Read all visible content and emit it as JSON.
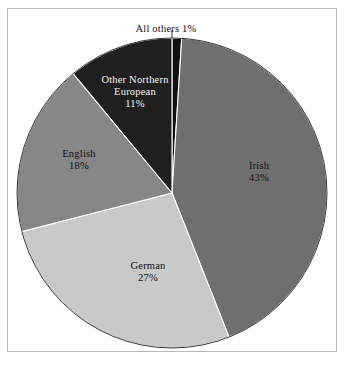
{
  "chart_data": {
    "type": "pie",
    "title": "",
    "subtitle": "",
    "xlabel": "",
    "ylabel": "",
    "legend_position": "none",
    "grid": false,
    "labels_inside_slices": true,
    "start_angle_deg": 0,
    "direction": "clockwise",
    "categories": [
      "All others",
      "Irish",
      "German",
      "English",
      "Other Northern European"
    ],
    "values": [
      1,
      43,
      27,
      18,
      11
    ],
    "value_suffix": "%",
    "slices": [
      {
        "label": "All others",
        "value": 1,
        "value_text": "1%",
        "display_text": "All others 1%",
        "color": "#111111",
        "text_color": "#111111",
        "label_placement": "outside-top-callout",
        "leader_line": true
      },
      {
        "label": "Irish",
        "value": 43,
        "value_text": "43%",
        "color": "#6f6f6f",
        "text_color": "#111111",
        "label_placement": "inside"
      },
      {
        "label": "German",
        "value": 27,
        "value_text": "27%",
        "color": "#c9c9c9",
        "text_color": "#111111",
        "label_placement": "inside"
      },
      {
        "label": "English",
        "value": 18,
        "value_text": "18%",
        "color": "#878787",
        "text_color": "#111111",
        "label_placement": "inside"
      },
      {
        "label": "Other Northern European",
        "label_line1": "Other Northern",
        "label_line2": "European",
        "value": 11,
        "value_text": "11%",
        "color": "#1f1f1f",
        "text_color": "#f2f2f2",
        "label_placement": "inside"
      }
    ]
  },
  "figure": {
    "background_color": "#ffffff",
    "frame_color": "#b9b9b9",
    "slice_edge_color": "#ffffff",
    "pie_outline_color": "#3b3b3b",
    "center_x": 172,
    "center_y": 193,
    "radius": 155
  }
}
